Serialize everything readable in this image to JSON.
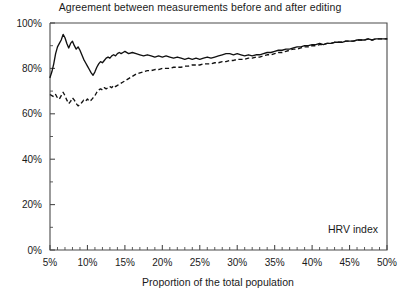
{
  "chart_data": {
    "type": "line",
    "title": "Agreement between measurements before and after editing",
    "xlabel": "Proportion of the total population",
    "ylabel": "",
    "xlim": [
      5,
      50
    ],
    "ylim": [
      0,
      100
    ],
    "grid": false,
    "legend_position": "inside-bottom-right",
    "annotations": [
      "HRV index"
    ],
    "xticklabels": [
      "5%",
      "10%",
      "15%",
      "20%",
      "25%",
      "30%",
      "35%",
      "40%",
      "45%",
      "50%"
    ],
    "xtickvalues": [
      5,
      10,
      15,
      20,
      25,
      30,
      35,
      40,
      45,
      50
    ],
    "yticklabels": [
      "0%",
      "20%",
      "40%",
      "60%",
      "80%",
      "100%"
    ],
    "ytickvalues": [
      0,
      20,
      40,
      60,
      80,
      100
    ],
    "x": [
      5.0,
      5.25,
      5.5,
      5.75,
      6.0,
      6.25,
      6.5,
      6.75,
      7.0,
      7.25,
      7.5,
      7.75,
      8.0,
      8.25,
      8.5,
      8.75,
      9.0,
      9.25,
      9.5,
      9.75,
      10.0,
      10.25,
      10.5,
      10.75,
      11.0,
      11.25,
      11.5,
      11.75,
      12.0,
      12.25,
      12.5,
      12.75,
      13.0,
      13.25,
      13.5,
      13.75,
      14.0,
      14.25,
      14.5,
      14.75,
      15.0,
      15.5,
      16.0,
      16.5,
      17.0,
      17.5,
      18.0,
      18.5,
      19.0,
      19.5,
      20.0,
      20.5,
      21.0,
      21.5,
      22.0,
      22.5,
      23.0,
      23.5,
      24.0,
      24.5,
      25.0,
      25.5,
      26.0,
      26.5,
      27.0,
      27.5,
      28.0,
      28.5,
      29.0,
      29.5,
      30.0,
      30.5,
      31.0,
      31.5,
      32.0,
      32.5,
      33.0,
      33.5,
      34.0,
      34.5,
      35.0,
      35.5,
      36.0,
      36.5,
      37.0,
      37.5,
      38.0,
      38.5,
      39.0,
      39.5,
      40.0,
      40.5,
      41.0,
      41.5,
      42.0,
      42.5,
      43.0,
      43.5,
      44.0,
      44.5,
      45.0,
      45.5,
      46.0,
      46.5,
      47.0,
      47.5,
      48.0,
      48.5,
      49.0,
      49.5,
      50.0
    ],
    "series": [
      {
        "name": "before editing",
        "style": "solid",
        "values": [
          76.0,
          78.5,
          82.0,
          86.5,
          89.5,
          91.0,
          92.5,
          95.0,
          93.5,
          91.0,
          89.0,
          91.0,
          92.0,
          90.0,
          88.5,
          89.5,
          88.0,
          86.0,
          84.0,
          82.5,
          81.0,
          79.5,
          78.0,
          77.0,
          78.5,
          80.5,
          82.0,
          83.0,
          82.5,
          83.5,
          84.5,
          85.0,
          84.5,
          85.5,
          86.0,
          85.5,
          86.5,
          87.0,
          86.5,
          87.0,
          87.5,
          86.5,
          87.0,
          86.5,
          86.0,
          85.5,
          86.0,
          85.5,
          85.0,
          85.5,
          85.0,
          85.5,
          85.0,
          84.5,
          85.0,
          84.5,
          84.0,
          84.5,
          84.0,
          84.5,
          84.0,
          84.5,
          85.0,
          84.5,
          85.0,
          85.5,
          86.0,
          86.5,
          86.5,
          86.0,
          86.5,
          86.0,
          85.5,
          86.0,
          85.5,
          86.0,
          86.0,
          86.5,
          87.0,
          87.0,
          87.5,
          88.0,
          88.0,
          88.5,
          88.5,
          89.0,
          89.5,
          89.5,
          90.0,
          90.0,
          90.5,
          90.5,
          91.0,
          90.5,
          91.0,
          91.0,
          91.5,
          91.5,
          91.5,
          92.0,
          92.0,
          92.0,
          92.5,
          92.5,
          92.5,
          93.0,
          92.5,
          93.0,
          93.0,
          93.0,
          93.0
        ]
      },
      {
        "name": "after editing",
        "style": "dashed",
        "values": [
          68.5,
          68.0,
          67.5,
          68.5,
          67.0,
          66.5,
          68.0,
          69.5,
          68.0,
          66.0,
          64.5,
          65.5,
          67.0,
          66.0,
          64.5,
          63.5,
          64.0,
          65.0,
          66.0,
          65.5,
          66.5,
          65.5,
          66.0,
          67.0,
          68.0,
          69.5,
          70.5,
          71.0,
          70.5,
          71.5,
          71.0,
          71.5,
          72.0,
          71.5,
          72.5,
          72.0,
          72.5,
          73.0,
          73.5,
          74.0,
          74.5,
          75.5,
          76.5,
          77.5,
          78.0,
          78.5,
          79.0,
          79.0,
          79.5,
          79.5,
          80.0,
          80.0,
          80.0,
          80.5,
          80.5,
          80.5,
          81.0,
          81.0,
          81.5,
          81.5,
          81.5,
          82.0,
          82.0,
          82.0,
          82.5,
          82.5,
          83.0,
          83.0,
          83.5,
          83.5,
          84.0,
          84.0,
          84.0,
          84.5,
          84.5,
          85.0,
          85.0,
          85.5,
          86.0,
          86.0,
          86.5,
          87.0,
          87.0,
          87.5,
          88.0,
          88.5,
          88.5,
          89.0,
          89.5,
          89.5,
          90.0,
          90.0,
          90.5,
          90.5,
          91.0,
          91.0,
          91.5,
          91.5,
          91.5,
          92.0,
          92.0,
          92.0,
          92.5,
          92.5,
          92.5,
          93.0,
          92.5,
          93.0,
          93.0,
          93.0,
          93.0
        ]
      }
    ]
  }
}
